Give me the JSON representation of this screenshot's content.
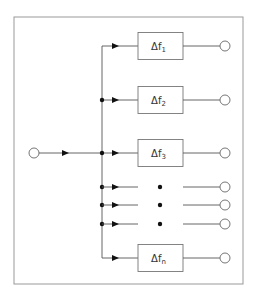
{
  "diagram": {
    "type": "filter-bank / frequency splitter block diagram",
    "frame": {
      "x": 14,
      "y": 17,
      "w": 229,
      "h": 267,
      "stroke": "#999999"
    },
    "colors": {
      "line": "#555555",
      "box": "#777777",
      "dot": "#111111",
      "circle": "#666666"
    },
    "input": {
      "cx": 34,
      "cy": 153,
      "r": 5
    },
    "bus": {
      "x": 102,
      "y_top": 46,
      "y_bottom": 258
    },
    "filters": [
      {
        "id": "f1",
        "label": "Δf",
        "subscript": "1",
        "y": 46,
        "junction_dot": false
      },
      {
        "id": "f2",
        "label": "Δf",
        "subscript": "2",
        "y": 100,
        "junction_dot": true
      },
      {
        "id": "f3",
        "label": "Δf",
        "subscript": "3",
        "y": 153,
        "junction_dot": true
      },
      {
        "id": "fn",
        "label": "Δf",
        "subscript": "n",
        "y": 258,
        "junction_dot": false
      }
    ],
    "ellipsis_rows": [
      {
        "y": 187
      },
      {
        "y": 205
      },
      {
        "y": 224
      }
    ],
    "box": {
      "x": 138,
      "w": 45,
      "h": 27
    },
    "output_circle": {
      "cx": 225,
      "r": 5
    }
  }
}
